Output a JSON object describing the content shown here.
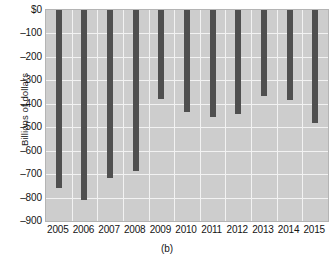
{
  "chart_data": {
    "type": "bar",
    "title": "",
    "subtitle": "",
    "caption": "(b)",
    "xlabel": "",
    "ylabel": "Billions of dollars",
    "categories": [
      "2005",
      "2006",
      "2007",
      "2008",
      "2009",
      "2010",
      "2011",
      "2012",
      "2013",
      "2014",
      "2015"
    ],
    "values": [
      -760,
      -810,
      -715,
      -685,
      -380,
      -435,
      -455,
      -445,
      -365,
      -385,
      -480
    ],
    "series": [
      {
        "name": "Trade balance",
        "values": [
          -760,
          -810,
          -715,
          -685,
          -380,
          -435,
          -455,
          -445,
          -365,
          -385,
          -480
        ]
      }
    ],
    "ylim": [
      -900,
      0
    ],
    "ytick_values": [
      0,
      -100,
      -200,
      -300,
      -400,
      -500,
      -600,
      -700,
      -800,
      -900
    ],
    "ytick_labels": [
      "$0",
      "–100",
      "–200",
      "–300",
      "–400",
      "–500",
      "–600",
      "–700",
      "–800",
      "–900"
    ],
    "grid": true,
    "legend": false,
    "legend_position": "none",
    "bar_color": "#4f4f4f",
    "plot_background": "#cdcdcd",
    "gridline_color": "#f2f2f2",
    "figure_background": "#ffffff",
    "bar_direction": "downward-from-zero"
  }
}
